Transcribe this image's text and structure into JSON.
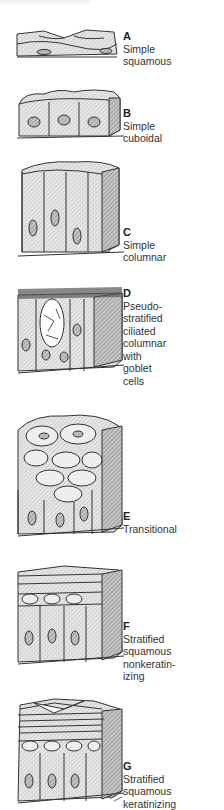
{
  "panels": [
    {
      "letter": "A",
      "label": "Simple\nsquamous"
    },
    {
      "letter": "B",
      "label": "Simple\ncuboidal"
    },
    {
      "letter": "C",
      "label": "Simple\ncolumnar"
    },
    {
      "letter": "D",
      "label": "Pseudo-\nstratified\nciliated\ncolumnar\nwith\ngoblet\ncells"
    },
    {
      "letter": "E",
      "label": "Transitional"
    },
    {
      "letter": "F",
      "label": "Stratified\nsquamous\nnonkeratin-\nizing"
    },
    {
      "letter": "G",
      "label": "Stratified\nsquamous\nkeratinizing"
    }
  ]
}
